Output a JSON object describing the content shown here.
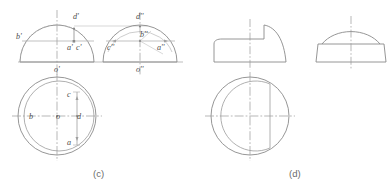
{
  "figure": {
    "width": 390,
    "height": 189,
    "background": "#ffffff",
    "colors": {
      "outline": "#8a8a8a",
      "thin": "#a8a8a8",
      "center": "#9a9a9a",
      "construction": "#b5b5b5",
      "label_text": "#4a4a4a",
      "caption_text": "#6a6a6a"
    },
    "captions": [
      {
        "id": "caption-c",
        "text": "(c)",
        "x": 100,
        "y": 174
      },
      {
        "id": "caption-d",
        "text": "(d)",
        "x": 296,
        "y": 174
      }
    ],
    "panels": [
      {
        "id": "panel-c",
        "caption": "(c)",
        "views": [
          {
            "id": "front-view-c",
            "name": "front-view",
            "labels": [
              {
                "text": "d'",
                "x": 75,
                "y": 17
              },
              {
                "text": "b'",
                "x": 17,
                "y": 39
              },
              {
                "text": "a'",
                "x": 70,
                "y": 48
              },
              {
                "text": "c'",
                "x": 79,
                "y": 48
              },
              {
                "text": "o'",
                "x": 57,
                "y": 70
              }
            ]
          },
          {
            "id": "side-view-c",
            "name": "side-view",
            "labels": [
              {
                "text": "d''",
                "x": 140,
                "y": 17
              },
              {
                "text": "b''",
                "x": 143,
                "y": 36
              },
              {
                "text": "c''",
                "x": 111,
                "y": 48
              },
              {
                "text": "a''",
                "x": 160,
                "y": 48
              },
              {
                "text": "o''",
                "x": 140,
                "y": 70
              }
            ]
          },
          {
            "id": "top-view-c",
            "name": "top-view",
            "labels": [
              {
                "text": "c",
                "x": 69,
                "y": 95
              },
              {
                "text": "b",
                "x": 31,
                "y": 116
              },
              {
                "text": "o",
                "x": 58,
                "y": 116
              },
              {
                "text": "d",
                "x": 79,
                "y": 116
              },
              {
                "text": "a",
                "x": 69,
                "y": 144
              }
            ]
          }
        ]
      },
      {
        "id": "panel-d",
        "caption": "(d)",
        "views": [
          {
            "id": "front-view-d",
            "name": "front-view",
            "labels": []
          },
          {
            "id": "side-view-d",
            "name": "side-view",
            "labels": []
          },
          {
            "id": "top-view-d",
            "name": "top-view",
            "labels": []
          }
        ]
      }
    ]
  }
}
